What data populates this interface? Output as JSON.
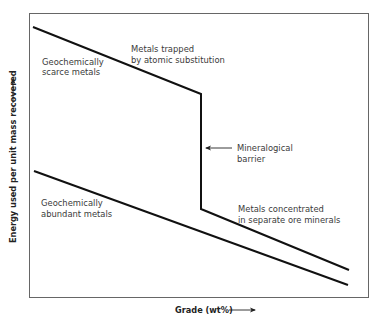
{
  "diagram": {
    "type": "line",
    "xlabel": "Grade (wt%)",
    "ylabel": "Energy used per unit mass recovered",
    "colors": {
      "lines": "#111111",
      "frame": "#666666",
      "text": "#3a3a3a"
    },
    "curves": [
      {
        "name": "Geochemically scarce metals",
        "points_px": [
          [
            33,
            27
          ],
          [
            201,
            94
          ],
          [
            201,
            209
          ],
          [
            349,
            270
          ]
        ]
      },
      {
        "name": "Geochemically abundant metals",
        "points_px": [
          [
            34,
            171
          ],
          [
            348,
            285
          ]
        ]
      }
    ],
    "annotations": {
      "scarce": [
        "Geochemically",
        "scarce metals"
      ],
      "abundant": [
        "Geochemically",
        "abundant metals"
      ],
      "trapped": [
        "Metals trapped",
        "by atomic substitution"
      ],
      "barrier": [
        "Mineralogical",
        "barrier"
      ],
      "concentrated": [
        "Metals concentrated",
        "in separate ore minerals"
      ]
    }
  }
}
